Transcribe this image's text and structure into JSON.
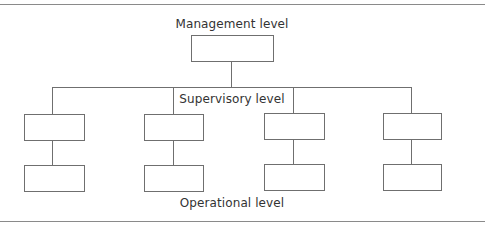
{
  "diagram": {
    "type": "organizational-hierarchy",
    "levels": [
      {
        "name": "management",
        "label": "Management level",
        "boxes": 1
      },
      {
        "name": "supervisory",
        "label": "Supervisory level",
        "boxes": 4
      },
      {
        "name": "operational",
        "label": "Operational level",
        "boxes": 4
      }
    ],
    "edges": [
      [
        "management-0",
        "supervisory-0"
      ],
      [
        "management-0",
        "supervisory-1"
      ],
      [
        "management-0",
        "supervisory-2"
      ],
      [
        "management-0",
        "supervisory-3"
      ],
      [
        "supervisory-0",
        "operational-0"
      ],
      [
        "supervisory-1",
        "operational-1"
      ],
      [
        "supervisory-2",
        "operational-2"
      ],
      [
        "supervisory-3",
        "operational-3"
      ]
    ]
  },
  "labels": {
    "management": "Management level",
    "supervisory": "Supervisory level",
    "operational": "Operational level"
  },
  "colors": {
    "line": "#6f6f6f",
    "rule": "#8a8a8a",
    "text": "#333333",
    "background": "#ffffff"
  }
}
